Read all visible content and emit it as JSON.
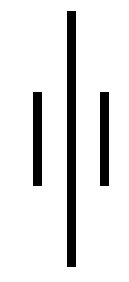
{
  "figure": {
    "width": 129,
    "height": 282,
    "background": "#ffffff",
    "bars": [
      {
        "id": "left-bar",
        "x": 33,
        "y": 92,
        "width": 9,
        "height": 94,
        "color": "#000000"
      },
      {
        "id": "center-bar",
        "x": 67,
        "y": 11,
        "width": 9,
        "height": 256,
        "color": "#000000"
      },
      {
        "id": "right-bar",
        "x": 100,
        "y": 92,
        "width": 9,
        "height": 94,
        "color": "#000000"
      }
    ]
  }
}
